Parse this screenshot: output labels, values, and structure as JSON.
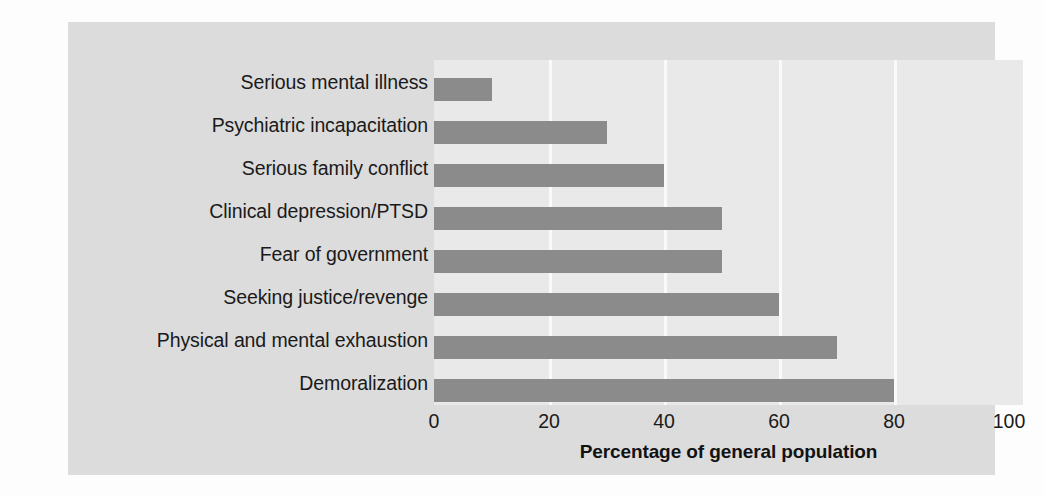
{
  "chart_data": {
    "type": "bar",
    "orientation": "horizontal",
    "title": "",
    "subtitle": "",
    "xlabel": "Percentage of general population",
    "ylabel": "",
    "categories": [
      "Serious mental illness",
      "Psychiatric incapacitation",
      "Serious family conflict",
      "Clinical depression/PTSD",
      "Fear of government",
      "Seeking justice/revenge",
      "Physical and mental exhaustion",
      "Demoralization"
    ],
    "values": [
      10,
      30,
      40,
      50,
      50,
      60,
      70,
      80
    ],
    "xlim": [
      0,
      100
    ],
    "xticks": [
      0,
      20,
      40,
      60,
      80,
      100
    ],
    "xtick_labels": [
      "0",
      "20",
      "40",
      "60",
      "80",
      "100"
    ],
    "grid": "vertical",
    "legend": "none",
    "bar_color": "#8b8b8b",
    "plot_background": "#e9e9e9",
    "panel_background": "#dcdcdc",
    "gridline_color": "#fafafa",
    "text_color": "#1a1a1a"
  }
}
